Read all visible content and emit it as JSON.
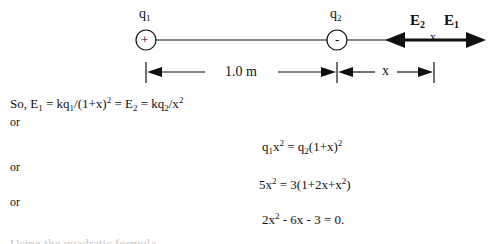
{
  "diagram": {
    "charge1": {
      "name": "q",
      "subscript": "1",
      "sign": "+"
    },
    "charge2": {
      "name": "q",
      "subscript": "2",
      "sign": "-"
    },
    "field_labels": {
      "e2": {
        "name": "E",
        "subscript": "2"
      },
      "e1": {
        "name": "E",
        "subscript": "1"
      },
      "point": "x"
    },
    "dimensions": {
      "separation": "1.0 m",
      "distance": "x"
    }
  },
  "equations": {
    "line1": {
      "prefix": "So, E",
      "s1": "1",
      "p2": " = kq",
      "s2": "1",
      "p3": "/(1+x)",
      "sup1": "2",
      "p4": " = E",
      "s3": "2",
      "p5": " = kq",
      "s4": "2",
      "p6": "/x",
      "sup2": "2"
    },
    "or1": "or",
    "eq2": {
      "a": "q",
      "s1": "1",
      "b": "x",
      "sup1": "2",
      "c": " = q",
      "s2": "2",
      "d": "(1+x)",
      "sup2": "2"
    },
    "or2": "or",
    "eq3": {
      "a": "5x",
      "sup1": "2",
      "b": " = 3(1+2x+x",
      "sup2": "2",
      "c": ")"
    },
    "or3": "or",
    "eq4": {
      "a": "2x",
      "sup1": "2",
      "b": " - 6x - 3 = 0."
    }
  },
  "truncated_line": "Using the quadratic formula..."
}
